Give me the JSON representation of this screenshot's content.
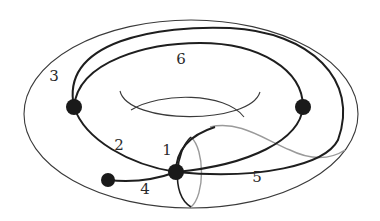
{
  "figure": {
    "colors": {
      "background": "#ffffff",
      "surface_outline": "#3a3a3a",
      "edge": "#1e1e1e",
      "hidden_curve": "#9a9a9a",
      "vertex": "#1a1a1a"
    },
    "vertices": [
      {
        "id": "v-left",
        "x": 74,
        "y": 107
      },
      {
        "id": "v-right",
        "x": 303,
        "y": 107
      },
      {
        "id": "v-center",
        "x": 176,
        "y": 172
      },
      {
        "id": "v-leaf",
        "x": 108,
        "y": 180
      }
    ],
    "edge_labels": [
      {
        "text": "1",
        "x": 167,
        "y": 150
      },
      {
        "text": "2",
        "x": 119,
        "y": 145
      },
      {
        "text": "3",
        "x": 54,
        "y": 76
      },
      {
        "text": "4",
        "x": 145,
        "y": 189
      },
      {
        "text": "5",
        "x": 257,
        "y": 177
      },
      {
        "text": "6",
        "x": 181,
        "y": 59
      }
    ]
  }
}
